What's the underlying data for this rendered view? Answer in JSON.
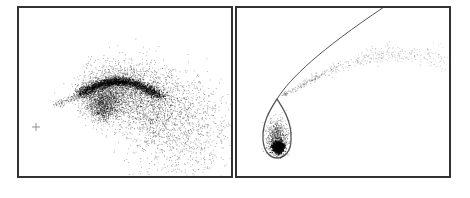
{
  "figure": {
    "panels": [
      {
        "id": "left",
        "description": "Diffuse comma-shaped point cloud with dense arc and faint tail; small cross marker at left",
        "marker": {
          "type": "cross",
          "x": 36,
          "y": 127,
          "size": 4,
          "color": "#888888"
        }
      },
      {
        "id": "right",
        "description": "Teardrop-shaped closed curve with dense core, continuing into a parabolic line; faint dotted stream above",
        "curve_color": "#555555",
        "core_color": "#000000"
      }
    ],
    "colors": {
      "frame": "#333333",
      "points": "#000000",
      "background": "#ffffff"
    }
  },
  "chart_data": [
    {
      "type": "scatter",
      "title": "",
      "xlabel": "",
      "ylabel": "",
      "grid": false,
      "legend": null,
      "annotations": [
        "cross marker at left"
      ],
      "series": [
        {
          "name": "diffuse cloud",
          "shape": "comma / crescent",
          "center_px": [
            140,
            105
          ],
          "extent_px": {
            "x": [
              55,
              205
            ],
            "y": [
              52,
              158
            ]
          },
          "dense_arc_px": [
            [
              85,
              92
            ],
            [
              120,
              83
            ],
            [
              155,
              95
            ]
          ],
          "tail_px": [
            [
              55,
              103
            ],
            [
              85,
              92
            ]
          ]
        }
      ]
    },
    {
      "type": "scatter",
      "title": "",
      "xlabel": "",
      "ylabel": "",
      "grid": false,
      "legend": null,
      "series": [
        {
          "name": "teardrop orbit",
          "shape": "closed teardrop curve",
          "apex_px": [
            277,
            99
          ],
          "bottom_px": [
            277,
            158
          ],
          "width_px": [
            263,
            291
          ],
          "dense_core_px": [
            278,
            147
          ]
        },
        {
          "name": "parabolic branch",
          "shape": "line",
          "points_px": [
            [
              277,
              99
            ],
            [
              300,
              70
            ],
            [
              340,
              35
            ],
            [
              384,
              7
            ]
          ]
        },
        {
          "name": "dotted stream",
          "shape": "sparse points",
          "points_px": [
            [
              283,
              95
            ],
            [
              320,
              68
            ],
            [
              360,
              52
            ],
            [
              400,
              45
            ],
            [
              445,
              65
            ]
          ]
        }
      ]
    }
  ]
}
